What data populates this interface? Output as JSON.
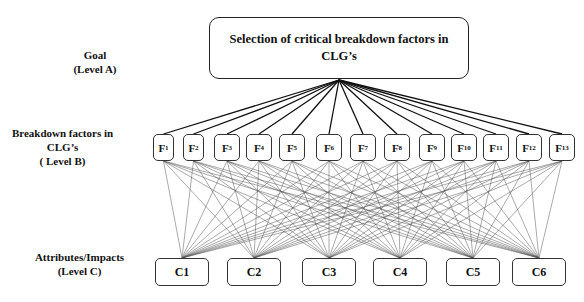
{
  "levels": {
    "a": {
      "line1": "Goal",
      "line2": "(Level A)"
    },
    "b": {
      "line1": "Breakdown factors in",
      "line2": "CLG’s",
      "line3": "( Level B)"
    },
    "c": {
      "line1": "Attributes/Impacts",
      "line2": "(Level C)"
    }
  },
  "goal": {
    "line1": "Selection of critical breakdown factors in",
    "line2": "CLG’s"
  },
  "factors": [
    {
      "letter": "F",
      "sub": "1"
    },
    {
      "letter": "F",
      "sub": "2"
    },
    {
      "letter": "F",
      "sub": "3"
    },
    {
      "letter": "F",
      "sub": "4"
    },
    {
      "letter": "F",
      "sub": "5"
    },
    {
      "letter": "F",
      "sub": "6"
    },
    {
      "letter": "F",
      "sub": "7"
    },
    {
      "letter": "F",
      "sub": "8"
    },
    {
      "letter": "F",
      "sub": "9"
    },
    {
      "letter": "F",
      "sub": "10"
    },
    {
      "letter": "F",
      "sub": "11"
    },
    {
      "letter": "F",
      "sub": "12"
    },
    {
      "letter": "F",
      "sub": "13"
    }
  ],
  "criteria": [
    {
      "label": "C1"
    },
    {
      "label": "C2"
    },
    {
      "label": "C3"
    },
    {
      "label": "C4"
    },
    {
      "label": "C5"
    },
    {
      "label": "C6"
    }
  ],
  "colors": {
    "line_goal": "#111111",
    "line_mesh": "#555555",
    "border": "#222222"
  }
}
